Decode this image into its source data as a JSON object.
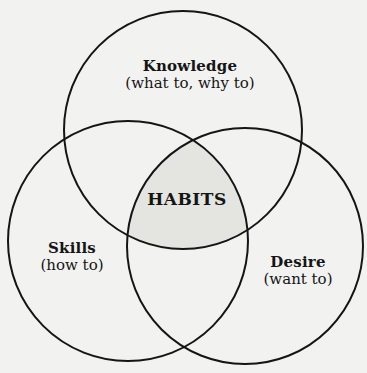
{
  "diagram": {
    "type": "venn",
    "colors": {
      "background": "#f2f2f0",
      "stroke": "#151515",
      "center_shade": "#e4e4e0"
    },
    "circles": [
      {
        "id": "knowledge",
        "cx": 183,
        "cy": 130,
        "r": 119,
        "title": "Knowledge",
        "subtitle": "(what to, why to)"
      },
      {
        "id": "skills",
        "cx": 128,
        "cy": 241,
        "r": 120,
        "title": "Skills",
        "subtitle": "(how to)"
      },
      {
        "id": "desire",
        "cx": 245,
        "cy": 246,
        "r": 118,
        "title": "Desire",
        "subtitle": "(want to)"
      }
    ],
    "intersection": {
      "label": "HABITS"
    }
  }
}
